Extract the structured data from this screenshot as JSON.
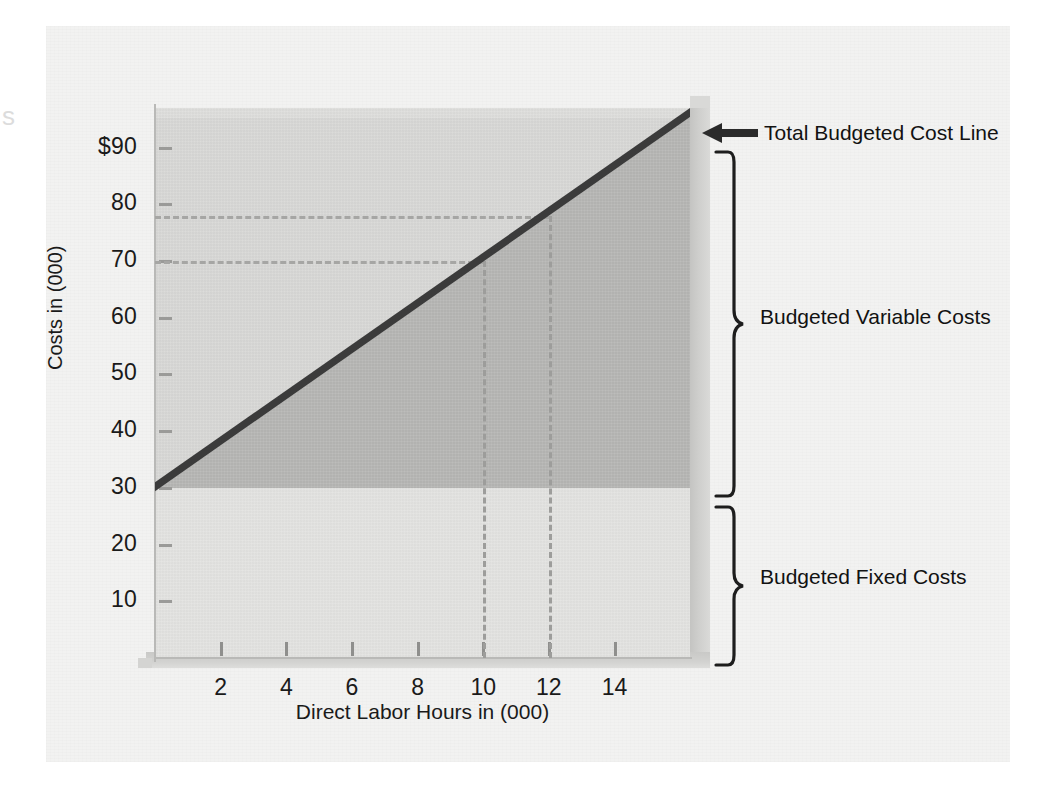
{
  "figure": {
    "page_bleed_glyph": "s"
  },
  "chart_data": {
    "type": "area",
    "title": "",
    "subtitle": "",
    "xlabel": "Direct Labor Hours in (000)",
    "ylabel": "Costs in (000)",
    "xlim": [
      0,
      16.3
    ],
    "ylim": [
      0,
      97
    ],
    "grid": false,
    "legend_position": "right-annotations",
    "x_ticks": [
      2,
      4,
      6,
      8,
      10,
      12,
      14
    ],
    "x_tick_labels": [
      "2",
      "4",
      "6",
      "8",
      "10",
      "12",
      "14"
    ],
    "y_ticks": [
      10,
      20,
      30,
      40,
      50,
      60,
      70,
      80,
      90
    ],
    "y_tick_labels": [
      "10",
      "20",
      "30",
      "40",
      "50",
      "60",
      "70",
      "80",
      "$90"
    ],
    "series": [
      {
        "name": "Total Budgeted Cost Line",
        "type": "line",
        "x": [
          0,
          16.3
        ],
        "values": [
          31,
          97
        ],
        "intercept": 31,
        "slope_per_1000_hours": 4.05,
        "color": "#3b3b3b"
      },
      {
        "name": "Budgeted Fixed Costs",
        "type": "area",
        "x": [
          0,
          16.3
        ],
        "values": [
          30,
          30
        ],
        "constant": 30,
        "color": "#e3e3e1"
      },
      {
        "name": "Budgeted Variable Costs",
        "type": "area",
        "x": [
          0,
          16.3
        ],
        "values": [
          1,
          67
        ],
        "color": "#b6b6b4"
      }
    ],
    "annotations": [
      {
        "name": "total-budgeted-cost-line",
        "text": "Total Budgeted Cost Line",
        "marker": "left-arrow",
        "points_to": {
          "x": 16.3,
          "y": 97
        }
      },
      {
        "name": "budgeted-variable-costs",
        "text": "Budgeted Variable Costs",
        "marker": "brace",
        "spans_y": [
          30,
          97
        ]
      },
      {
        "name": "budgeted-fixed-costs",
        "text": "Budgeted Fixed Costs",
        "marker": "brace",
        "spans_y": [
          0,
          30
        ]
      }
    ],
    "reference_lines": [
      {
        "name": "cost-at-10000-hours",
        "orientation": "horizontal",
        "value": 70,
        "from_x": 0,
        "to_x": 10
      },
      {
        "name": "cost-at-12000-hours",
        "orientation": "horizontal",
        "value": 78,
        "from_x": 0,
        "to_x": 12
      },
      {
        "name": "hours-10000",
        "orientation": "vertical",
        "value": 10,
        "from_y": 0,
        "to_y": 70
      },
      {
        "name": "hours-12000",
        "orientation": "vertical",
        "value": 12,
        "from_y": 0,
        "to_y": 78
      }
    ],
    "colors": {
      "plot_background": "#d8d8d6",
      "fixed_band": "#e3e3e1",
      "variable_band": "#b6b6b4",
      "cost_line": "#3b3b3b",
      "dash": "#a6a6a4",
      "panel": "#f2f2f1",
      "shadow": "#cdcdcb"
    }
  }
}
